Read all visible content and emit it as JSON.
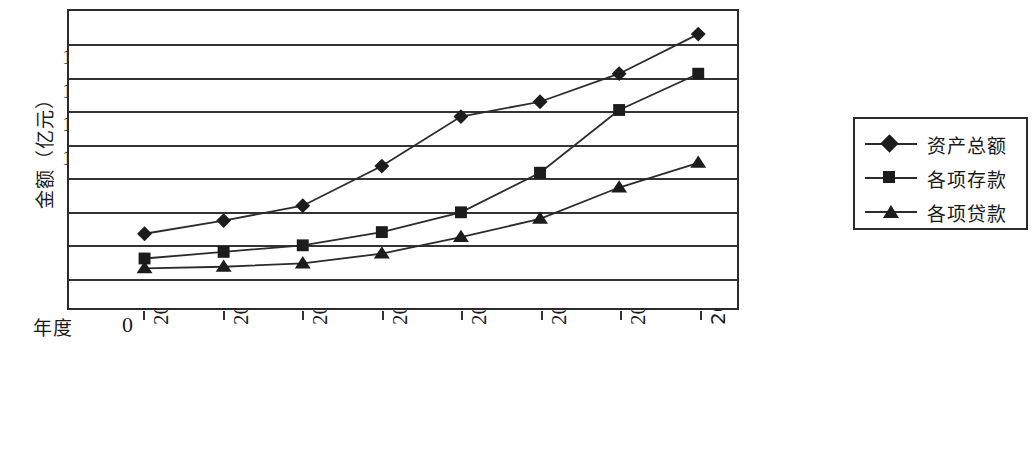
{
  "chart_data": {
    "type": "line",
    "title": "",
    "xlabel": "年度",
    "ylabel": "金额（亿元）",
    "categories": [
      "2003",
      "2004",
      "2005",
      "2006",
      "2007",
      "2008",
      "2009",
      "2010年9月末"
    ],
    "ylim": [
      0,
      1800
    ],
    "yticks": [
      200,
      400,
      600,
      800,
      1000,
      1200,
      1400,
      1600
    ],
    "ytick_labels": [
      "200",
      "400",
      "600",
      "800",
      "1000",
      "1200",
      "1400",
      "1600"
    ],
    "zero_label": "0",
    "grid": true,
    "legend_position": "right",
    "series": [
      {
        "name": "资产总额",
        "marker": "diamond",
        "values": [
          450,
          530,
          620,
          860,
          1160,
          1250,
          1420,
          1660
        ]
      },
      {
        "name": "各项存款",
        "marker": "square",
        "values": [
          300,
          340,
          380,
          460,
          580,
          820,
          1200,
          1420
        ]
      },
      {
        "name": "各项贷款",
        "marker": "triangle",
        "values": [
          240,
          250,
          270,
          330,
          430,
          540,
          730,
          880
        ]
      }
    ]
  },
  "legend": {
    "items": [
      {
        "label": "资产总额",
        "marker": "diamond"
      },
      {
        "label": "各项存款",
        "marker": "square"
      },
      {
        "label": "各项贷款",
        "marker": "triangle"
      }
    ]
  },
  "colors": {
    "line": "#2b2b2b",
    "marker": "#1c1c1c",
    "grid": "#333333",
    "background": "#ffffff"
  }
}
